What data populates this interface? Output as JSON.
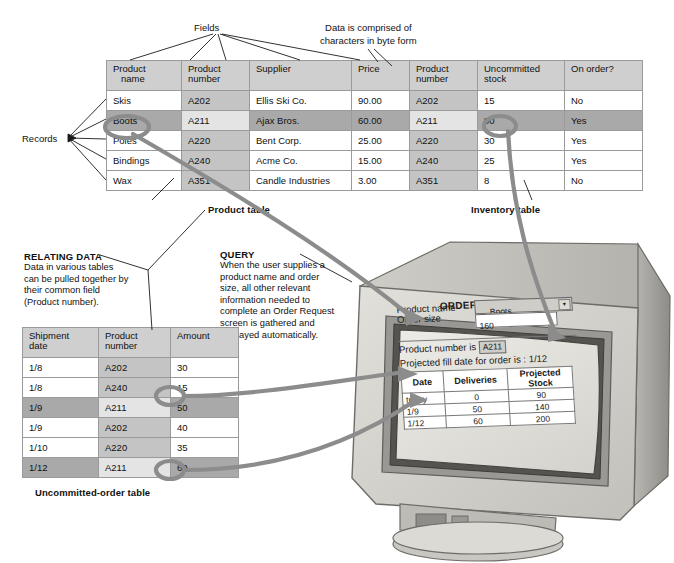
{
  "annotations": {
    "fields_label": "Fields",
    "bytes_label_line1": "Data is comprised of",
    "bytes_label_line2": "characters in byte form",
    "records_label": "Records",
    "relating_title": "RELATING DATA",
    "relating_body": "Data in various tables can be pulled together by their common field (Product number).",
    "query_title": "QUERY",
    "query_body": "When the user supplies a product name and order size, all other relevant information needed to complete an Order Request screen is gathered and displayed automatically."
  },
  "product_table": {
    "caption": "Product table",
    "headers": [
      "Product name",
      "Product number",
      "Supplier",
      "Price"
    ],
    "header_lines": [
      [
        "Product",
        "name"
      ],
      [
        "Product",
        "number"
      ],
      [
        "Supplier",
        ""
      ],
      [
        "Price",
        ""
      ]
    ],
    "rows": [
      {
        "name": "Skis",
        "number": "A202",
        "supplier": "Ellis Ski Co.",
        "price": "90.00",
        "highlight": false
      },
      {
        "name": "Boots",
        "number": "A211",
        "supplier": "Ajax Bros.",
        "price": "60.00",
        "highlight": true
      },
      {
        "name": "Poles",
        "number": "A220",
        "supplier": "Bent Corp.",
        "price": "25.00",
        "highlight": false
      },
      {
        "name": "Bindings",
        "number": "A240",
        "supplier": "Acme Co.",
        "price": "15.00",
        "highlight": false
      },
      {
        "name": "Wax",
        "number": "A351",
        "supplier": "Candle Industries",
        "price": "3.00",
        "highlight": false
      }
    ]
  },
  "inventory_table": {
    "caption": "Inventory table",
    "headers": [
      "Product number",
      "Uncommitted stock",
      "On order?"
    ],
    "header_lines": [
      [
        "Product",
        "number"
      ],
      [
        "Uncommitted",
        "stock"
      ],
      [
        "On order?",
        ""
      ]
    ],
    "rows": [
      {
        "number": "A202",
        "stock": "15",
        "on_order": "No",
        "highlight": false
      },
      {
        "number": "A211",
        "stock": "90",
        "on_order": "Yes",
        "highlight": true
      },
      {
        "number": "A220",
        "stock": "30",
        "on_order": "Yes",
        "highlight": false
      },
      {
        "number": "A240",
        "stock": "25",
        "on_order": "Yes",
        "highlight": false
      },
      {
        "number": "A351",
        "stock": "8",
        "on_order": "No",
        "highlight": false
      }
    ]
  },
  "order_table": {
    "caption": "Uncommitted-order table",
    "headers": [
      "Shipment date",
      "Product number",
      "Amount"
    ],
    "header_lines": [
      [
        "Shipment",
        "date"
      ],
      [
        "Product",
        "number"
      ],
      [
        "Amount",
        ""
      ]
    ],
    "rows": [
      {
        "date": "1/8",
        "number": "A202",
        "amount": "30",
        "highlight": false
      },
      {
        "date": "1/8",
        "number": "A240",
        "amount": "15",
        "highlight": false
      },
      {
        "date": "1/9",
        "number": "A211",
        "amount": "50",
        "highlight": true
      },
      {
        "date": "1/9",
        "number": "A202",
        "amount": "40",
        "highlight": false
      },
      {
        "date": "1/10",
        "number": "A220",
        "amount": "35",
        "highlight": false
      },
      {
        "date": "1/12",
        "number": "A211",
        "amount": "60",
        "highlight": true
      }
    ]
  },
  "screen": {
    "title": "ORDER REQUEST",
    "product_name_label": "Product name",
    "product_name_value": "Boots",
    "order_size_label": "Order size",
    "order_size_value": "160",
    "product_number_label": "Product number is",
    "product_number_value": "A211",
    "fill_date_text": "Projected fill date for order is : 1/12",
    "table_headers": [
      "Date",
      "Deliveries",
      "Projected Stock"
    ],
    "table_rows": [
      {
        "date": "today",
        "deliveries": "0",
        "stock": "90"
      },
      {
        "date": "1/9",
        "deliveries": "50",
        "stock": "140"
      },
      {
        "date": "1/12",
        "deliveries": "60",
        "stock": "200"
      }
    ]
  },
  "colors": {
    "highlight_row": "#a9a9a9",
    "column_shade": "#c4c4c4",
    "header_shade": "#cfcfcf",
    "connector": "#8c8c8c",
    "monitor_body": "#d4d2cd",
    "monitor_bezel": "#6f6d6a",
    "screen": "#e4e3df"
  }
}
